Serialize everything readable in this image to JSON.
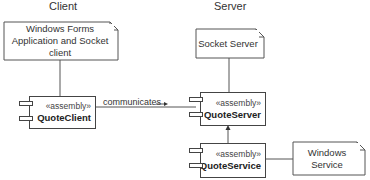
{
  "columns": {
    "client": "Client",
    "server": "Server"
  },
  "notes": {
    "client_note": "Windows Forms Application and Socket client",
    "server_note": "Socket Server",
    "service_note": "Windows Service"
  },
  "components": [
    {
      "id": "quote-client",
      "stereotype": "«assembly»",
      "name": "QuoteClient"
    },
    {
      "id": "quote-server",
      "stereotype": "«assembly»",
      "name": "QuoteServer"
    },
    {
      "id": "quote-service",
      "stereotype": "«assembly»",
      "name": "QuoteService"
    }
  ],
  "edges": {
    "communicates": "communicates"
  },
  "colors": {
    "line": "#444444",
    "text": "#333333",
    "background": "#ffffff"
  }
}
